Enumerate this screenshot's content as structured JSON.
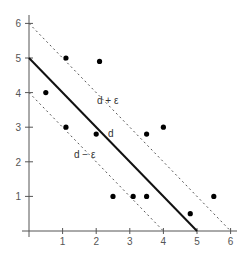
{
  "chart_data": {
    "type": "scatter",
    "title": "",
    "xlabel": "",
    "ylabel": "",
    "xlim": [
      0,
      6.2
    ],
    "ylim": [
      0,
      6.2
    ],
    "grid": false,
    "legend": null,
    "x_ticks": [
      "1",
      "2",
      "3",
      "4",
      "5",
      "6"
    ],
    "y_ticks": [
      "1",
      "2",
      "3",
      "4",
      "5",
      "6"
    ],
    "points": [
      {
        "x": 0.5,
        "y": 4.0
      },
      {
        "x": 1.1,
        "y": 5.0
      },
      {
        "x": 2.1,
        "y": 4.9
      },
      {
        "x": 1.1,
        "y": 3.0
      },
      {
        "x": 2.0,
        "y": 2.8
      },
      {
        "x": 3.5,
        "y": 2.8
      },
      {
        "x": 4.0,
        "y": 3.0
      },
      {
        "x": 2.5,
        "y": 1.0
      },
      {
        "x": 3.1,
        "y": 1.0
      },
      {
        "x": 3.5,
        "y": 1.0
      },
      {
        "x": 4.8,
        "y": 0.5
      },
      {
        "x": 5.5,
        "y": 1.0
      }
    ],
    "lines": [
      {
        "name": "d",
        "style": "solid",
        "x": [
          0,
          5
        ],
        "y": [
          5,
          0
        ]
      },
      {
        "name": "d + ε",
        "style": "dashed",
        "x": [
          0,
          6
        ],
        "y": [
          6,
          0
        ]
      },
      {
        "name": "d − ε",
        "style": "dashed",
        "x": [
          0,
          4
        ],
        "y": [
          4,
          0
        ]
      }
    ],
    "annotations": [
      {
        "text": "d + ε",
        "x": 2.1,
        "y": 3.75
      },
      {
        "text": "d",
        "x": 2.35,
        "y": 2.8
      },
      {
        "text": "d − ε",
        "x": 1.35,
        "y": 2.2
      }
    ]
  },
  "labels": {
    "upper": "d + ε",
    "middle": "d",
    "lower": "d − ε"
  }
}
